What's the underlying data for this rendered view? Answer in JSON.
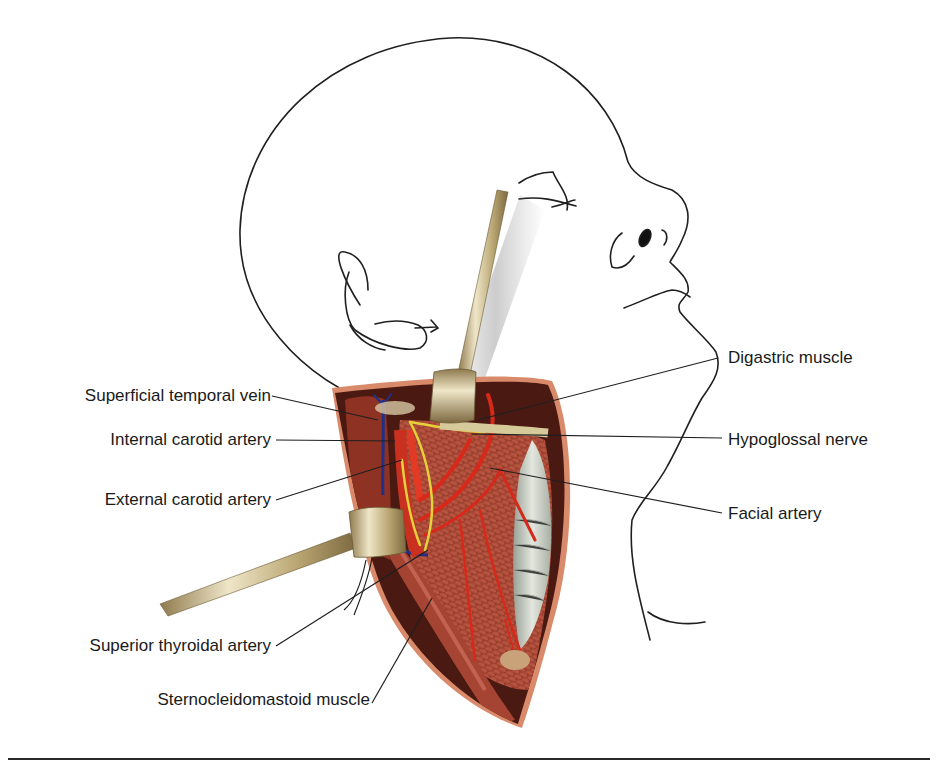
{
  "figure": {
    "labels_left": [
      {
        "id": "superficial-temporal-vein",
        "text": "Superficial temporal vein"
      },
      {
        "id": "internal-carotid-artery",
        "text": "Internal carotid artery"
      },
      {
        "id": "external-carotid-artery",
        "text": "External carotid artery"
      },
      {
        "id": "superior-thyroidal-artery",
        "text": "Superior thyroidal artery"
      },
      {
        "id": "sternocleidomastoid-muscle",
        "text": "Sternocleidomastoid muscle"
      }
    ],
    "labels_right": [
      {
        "id": "digastric-muscle",
        "text": "Digastric muscle"
      },
      {
        "id": "hypoglossal-nerve",
        "text": "Hypoglossal nerve"
      },
      {
        "id": "facial-artery",
        "text": "Facial artery"
      }
    ],
    "colors": {
      "outline": "#1f1f1f",
      "muscle": "#b5523e",
      "muscle_dark": "#7a2a1e",
      "artery": "#d8281a",
      "vein": "#1f2f8a",
      "nerve": "#e5d23a",
      "retractor": "#c9b98a",
      "trachea": "#c9cfc4",
      "skin_edge": "#d98a6a"
    }
  }
}
